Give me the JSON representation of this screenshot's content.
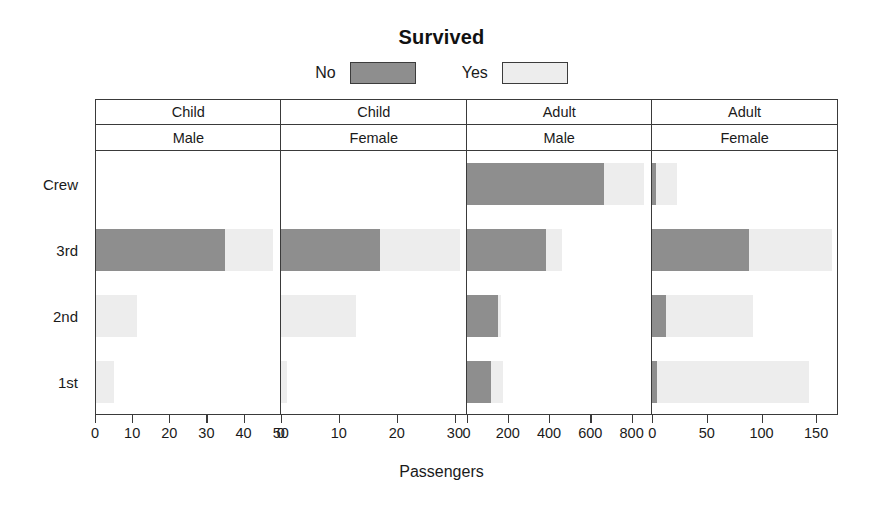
{
  "chart_data": {
    "type": "bar",
    "orientation": "horizontal",
    "title": "Survived",
    "xlabel": "Passengers",
    "ylabel": "",
    "stacked": true,
    "grid": false,
    "legend_position": "top",
    "legend": [
      {
        "label": "No",
        "color": "#8e8e8e"
      },
      {
        "label": "Yes",
        "color": "#ededed"
      }
    ],
    "categories": [
      "Crew",
      "3rd",
      "2nd",
      "1st"
    ],
    "panels": [
      {
        "age": "Child",
        "sex": "Male",
        "xlim": [
          0,
          50
        ],
        "ticks": [
          0,
          10,
          20,
          30,
          40,
          50
        ],
        "series": [
          {
            "name": "No",
            "values": [
              0,
              35,
              0,
              0
            ]
          },
          {
            "name": "Yes",
            "values": [
              0,
              13,
              11,
              5
            ]
          }
        ]
      },
      {
        "age": "Child",
        "sex": "Female",
        "xlim": [
          0,
          32
        ],
        "ticks": [
          0,
          10,
          20,
          30
        ],
        "series": [
          {
            "name": "No",
            "values": [
              0,
              17,
              0,
              0
            ]
          },
          {
            "name": "Yes",
            "values": [
              0,
              14,
              13,
              1
            ]
          }
        ]
      },
      {
        "age": "Adult",
        "sex": "Male",
        "xlim": [
          0,
          900
        ],
        "ticks": [
          0,
          200,
          400,
          600,
          800
        ],
        "series": [
          {
            "name": "No",
            "values": [
              670,
              387,
              154,
              118
            ]
          },
          {
            "name": "Yes",
            "values": [
              192,
              75,
              14,
              57
            ]
          }
        ]
      },
      {
        "age": "Adult",
        "sex": "Female",
        "xlim": [
          0,
          170
        ],
        "ticks": [
          0,
          50,
          100,
          150
        ],
        "series": [
          {
            "name": "No",
            "values": [
              3,
              89,
              13,
              4
            ]
          },
          {
            "name": "Yes",
            "values": [
              20,
              76,
              80,
              140
            ]
          }
        ]
      }
    ]
  },
  "title": {
    "text": "Survived"
  },
  "legend": {
    "no_label": "No",
    "yes_label": "Yes"
  },
  "strips": {
    "age_row": [
      "Child",
      "Child",
      "Adult",
      "Adult"
    ],
    "sex_row": [
      "Male",
      "Female",
      "Male",
      "Female"
    ]
  },
  "axis": {
    "y_labels": [
      "Crew",
      "3rd",
      "2nd",
      "1st"
    ],
    "x_title": "Passengers",
    "x_ticks": [
      [
        "0",
        "10",
        "20",
        "30",
        "40",
        "50"
      ],
      [
        "0",
        "10",
        "20",
        "30"
      ],
      [
        "0",
        "200",
        "400",
        "600",
        "800"
      ],
      [
        "0",
        "50",
        "100",
        "150"
      ]
    ]
  },
  "colors": {
    "no": "#8e8e8e",
    "yes": "#ededed",
    "frame": "#3a3a3a",
    "text": "#1a1a1a",
    "background": "#ffffff"
  }
}
